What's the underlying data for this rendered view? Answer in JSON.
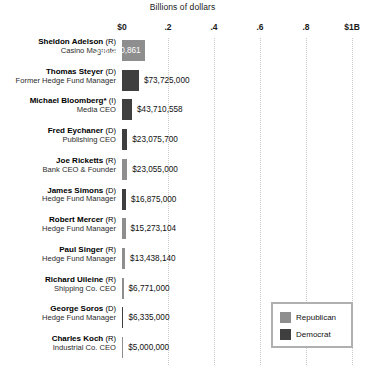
{
  "chart_data": {
    "type": "bar",
    "orientation": "horizontal",
    "title": "Billions of dollars",
    "xlabel": "Billions of dollars",
    "ylabel": "",
    "xlim": [
      0,
      1000000000
    ],
    "grid": true,
    "tick_labels": [
      "$0",
      ".2",
      ".4",
      ".6",
      ".8",
      "$1B"
    ],
    "tick_values": [
      0,
      0.2,
      0.4,
      0.6,
      0.8,
      1.0
    ],
    "legend_position": "bottom-right",
    "legend": [
      {
        "label": "Republican",
        "color": "#8e8e8e"
      },
      {
        "label": "Democrat",
        "color": "#3f3f3f"
      }
    ],
    "categories": [
      "Sheldon Adelson",
      "Thomas Steyer",
      "Michael Bloomberg*",
      "Fred Eychaner",
      "Joe Ricketts",
      "James Simons",
      "Robert Mercer",
      "Paul Singer",
      "Richard Uileine",
      "George Soros",
      "Charles Koch"
    ],
    "values": [
      98320861,
      73725000,
      43710558,
      23075700,
      23055000,
      16875000,
      15273104,
      13438140,
      6771000,
      6335000,
      5000000
    ],
    "value_labels": [
      "$98,320,861",
      "$73,725,000",
      "$43,710,558",
      "$23,075,700",
      "$23,055,000",
      "$16,875,000",
      "$15,273,104",
      "$13,438,140",
      "$6,771,000",
      "$6,335,000",
      "$5,000,000"
    ],
    "rows": [
      {
        "name": "Sheldon Adelson",
        "party": "(R)",
        "role": "Casino Magnate",
        "value": 98320861,
        "value_label": "$98,320,861",
        "color": "#8e8e8e",
        "label_inside": true
      },
      {
        "name": "Thomas Steyer",
        "party": "(D)",
        "role": "Former Hedge Fund Manager",
        "value": 73725000,
        "value_label": "$73,725,000",
        "color": "#3f3f3f",
        "label_inside": false
      },
      {
        "name": "Michael Bloomberg*",
        "party": "(I)",
        "role": "Media CEO",
        "value": 43710558,
        "value_label": "$43,710,558",
        "color": "#3f3f3f",
        "label_inside": false
      },
      {
        "name": "Fred Eychaner",
        "party": "(D)",
        "role": "Publishing CEO",
        "value": 23075700,
        "value_label": "$23,075,700",
        "color": "#3f3f3f",
        "label_inside": false
      },
      {
        "name": "Joe Ricketts",
        "party": "(R)",
        "role": "Bank CEO & Founder",
        "value": 23055000,
        "value_label": "$23,055,000",
        "color": "#8e8e8e",
        "label_inside": false
      },
      {
        "name": "James Simons",
        "party": "(D)",
        "role": "Hedge Fund Manager",
        "value": 16875000,
        "value_label": "$16,875,000",
        "color": "#3f3f3f",
        "label_inside": false
      },
      {
        "name": "Robert Mercer",
        "party": "(R)",
        "role": "Hedge Fund Manager",
        "value": 15273104,
        "value_label": "$15,273,104",
        "color": "#8e8e8e",
        "label_inside": false
      },
      {
        "name": "Paul Singer",
        "party": "(R)",
        "role": "Hedge Fund Manager",
        "value": 13438140,
        "value_label": "$13,438,140",
        "color": "#8e8e8e",
        "label_inside": false
      },
      {
        "name": "Richard Uileine",
        "party": "(R)",
        "role": "Shipping Co. CEO",
        "value": 6771000,
        "value_label": "$6,771,000",
        "color": "#8e8e8e",
        "label_inside": false
      },
      {
        "name": "George Soros",
        "party": "(D)",
        "role": "Hedge Fund Manager",
        "value": 6335000,
        "value_label": "$6,335,000",
        "color": "#3f3f3f",
        "label_inside": false
      },
      {
        "name": "Charles Koch",
        "party": "(R)",
        "role": "Industrial Co. CEO",
        "value": 5000000,
        "value_label": "$5,000,000",
        "color": "#8e8e8e",
        "label_inside": false
      }
    ]
  }
}
